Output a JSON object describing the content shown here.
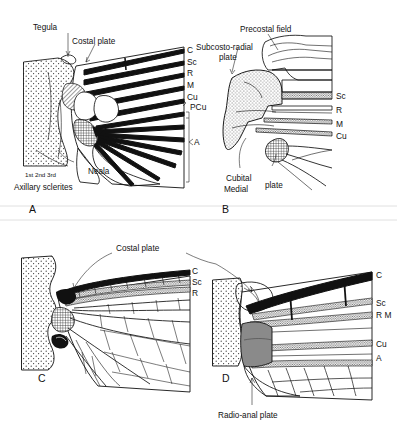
{
  "figure": {
    "background_color": "#ffffff",
    "ink_color": "#111111"
  },
  "panels": [
    {
      "id": "A",
      "letter": "A",
      "annotations": [
        {
          "name": "tegula",
          "text": "Tegula"
        },
        {
          "name": "costal-plate",
          "text": "Costal plate"
        },
        {
          "name": "neala",
          "text": "Neala"
        },
        {
          "name": "sclerite-numbers",
          "text": "1st 2nd 3rd"
        },
        {
          "name": "axillary-sclerites",
          "text": "Axillary sclerites"
        }
      ],
      "vein_labels": [
        {
          "name": "vein-c",
          "text": "C"
        },
        {
          "name": "vein-sc",
          "text": "Sc"
        },
        {
          "name": "vein-r",
          "text": "R"
        },
        {
          "name": "vein-m",
          "text": "M"
        },
        {
          "name": "vein-cu",
          "text": "Cu"
        },
        {
          "name": "vein-pcu",
          "text": "PCu"
        },
        {
          "name": "vein-a",
          "text": "A"
        }
      ]
    },
    {
      "id": "B",
      "letter": "B",
      "annotations": [
        {
          "name": "precostal-field",
          "text": "Precostal field"
        },
        {
          "name": "subcosto-radial-plate-line1",
          "text": "Subcosto-radial"
        },
        {
          "name": "subcosto-radial-plate-line2",
          "text": "plate"
        },
        {
          "name": "cubital-label",
          "text": "Cubital"
        },
        {
          "name": "medial-label",
          "text": "Medial"
        },
        {
          "name": "plate-label",
          "text": "plate"
        }
      ],
      "vein_labels": [
        {
          "name": "vein-sc",
          "text": "Sc"
        },
        {
          "name": "vein-r",
          "text": "R"
        },
        {
          "name": "vein-m",
          "text": "M"
        },
        {
          "name": "vein-cu",
          "text": "Cu"
        }
      ]
    },
    {
      "id": "C",
      "letter": "C",
      "annotations": [
        {
          "name": "costal-plate",
          "text": "Costal plate"
        }
      ],
      "vein_labels": [
        {
          "name": "vein-c",
          "text": "C"
        },
        {
          "name": "vein-sc",
          "text": "Sc"
        },
        {
          "name": "vein-r",
          "text": "R"
        }
      ]
    },
    {
      "id": "D",
      "letter": "D",
      "annotations": [
        {
          "name": "radio-anal-plate",
          "text": "Radio-anal plate"
        }
      ],
      "vein_labels": [
        {
          "name": "vein-c",
          "text": "C"
        },
        {
          "name": "vein-sc",
          "text": "Sc"
        },
        {
          "name": "vein-rm",
          "text": "R M"
        },
        {
          "name": "vein-cu",
          "text": "Cu"
        },
        {
          "name": "vein-a",
          "text": "A"
        }
      ]
    }
  ]
}
